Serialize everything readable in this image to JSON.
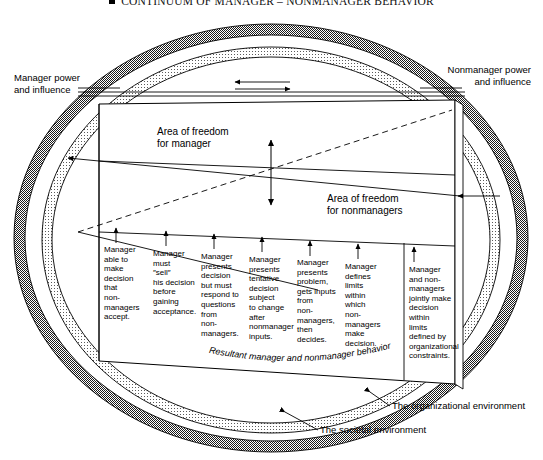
{
  "figure": {
    "title": "CONTINUUM OF MANAGER – NONMANAGER BEHAVIOR",
    "bullet_icon": "square-bullet-icon"
  },
  "labels": {
    "manager_power": "Manager power\nand influence",
    "nonmanager_power": "Nonmanager power\nand influence",
    "area_freedom_manager": "Area of freedom\nfor manager",
    "area_freedom_nonmanagers": "Area of freedom\nfor nonmanagers",
    "resultant_behavior": "Resultant manager and nonmanager behavior",
    "organizational_environment": "The organizational environment",
    "societal_environment": "The societal environment"
  },
  "columns": [
    {
      "id": 1,
      "text": "Manager\nable to\nmake\ndecision\nthat\nnon-\nmanagers\naccept."
    },
    {
      "id": 2,
      "text": "Manager\nmust\n″sell″\nhis decision\nbefore\ngaining\nacceptance."
    },
    {
      "id": 3,
      "text": "Manager\npresents\ndecision\nbut must\nrespond to\nquestions\nfrom\nnon-\nmanagers."
    },
    {
      "id": 4,
      "text": "Manager\npresents\ntentative\ndecision\nsubject\nto change\nafter\nnonmanager\ninputs."
    },
    {
      "id": 5,
      "text": "Manager\npresents\nproblem,\ngets inputs\nfrom\nnon-\nmanagers,\nthen\ndecides."
    },
    {
      "id": 6,
      "text": "Manager\ndefines\nlimits\nwithin\nwhich\nnon-\nmanagers\nmake\ndecision."
    },
    {
      "id": 7,
      "text": "Manager\nand non-\nmanagers\njointly make\ndecision\nwithin\nlimits\ndefined by\norganizational\nconstraints."
    }
  ],
  "colors": {
    "outer_ring": "#6f6f6f",
    "inner_ring": "#c9c9c9",
    "line": "#000000",
    "background": "#ffffff"
  },
  "arrows": {
    "top_left_arrow": "arrow pointing left",
    "top_right_arrow": "arrow pointing right",
    "center_vertical_arrow": "double-headed vertical arrow",
    "column_arrows": "upward arrows above each behavior column"
  }
}
